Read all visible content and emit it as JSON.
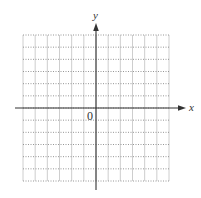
{
  "diagram": {
    "type": "coordinate-grid",
    "x_axis_label": "x",
    "y_axis_label": "y",
    "origin_label": "0",
    "grid": {
      "columns": 12,
      "rows": 12,
      "x_range": [
        -6,
        6
      ],
      "y_range": [
        -6,
        6
      ],
      "vertical_lines_style": "solid",
      "horizontal_lines_style": "dotted"
    },
    "colors": {
      "axis": "#333333",
      "vertical_grid": "#c8c8c8",
      "horizontal_grid": "#8a8a8a",
      "background": "#ffffff"
    }
  }
}
